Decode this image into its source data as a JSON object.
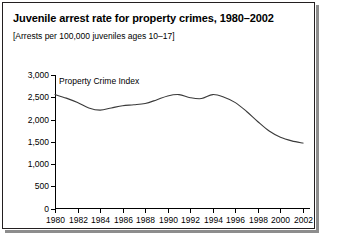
{
  "figure": {
    "title": "Juvenile arrest rate for property crimes, 1980–2002",
    "subtitle": "[Arrests per 100,000 juveniles ages 10–17]",
    "series_label": "Property Crime Index",
    "line_color": "#3a3a3a",
    "axis_color": "#000000",
    "border_color": "#231f20"
  },
  "chart_data": {
    "type": "line",
    "title": "Juvenile arrest rate for property crimes, 1980–2002",
    "subtitle": "[Arrests per 100,000 juveniles ages 10–17]",
    "xlabel": "",
    "ylabel": "",
    "xlim": [
      1980,
      2002
    ],
    "ylim": [
      0,
      3000
    ],
    "yticks": [
      0,
      500,
      1000,
      1500,
      2000,
      2500,
      3000
    ],
    "ytick_labels": [
      "0",
      "500",
      "1,000",
      "1,500",
      "2,000",
      "2,500",
      "3,000"
    ],
    "xticks": [
      1980,
      1982,
      1984,
      1986,
      1988,
      1990,
      1992,
      1994,
      1996,
      1998,
      2000,
      2002
    ],
    "xtick_labels": [
      "1980",
      "1982",
      "1984",
      "1986",
      "1988",
      "1990",
      "1992",
      "1994",
      "1996",
      "1998",
      "2000",
      "2002"
    ],
    "grid": false,
    "legend_position": "inline-above-line",
    "series": [
      {
        "name": "Property Crime Index",
        "x": [
          1980,
          1981,
          1982,
          1983,
          1984,
          1985,
          1986,
          1987,
          1988,
          1989,
          1990,
          1991,
          1992,
          1993,
          1994,
          1995,
          1996,
          1997,
          1998,
          1999,
          2000,
          2001,
          2002
        ],
        "values": [
          2560,
          2480,
          2380,
          2260,
          2210,
          2260,
          2310,
          2330,
          2360,
          2440,
          2530,
          2560,
          2490,
          2470,
          2560,
          2500,
          2380,
          2180,
          1950,
          1740,
          1600,
          1520,
          1470
        ]
      }
    ]
  }
}
